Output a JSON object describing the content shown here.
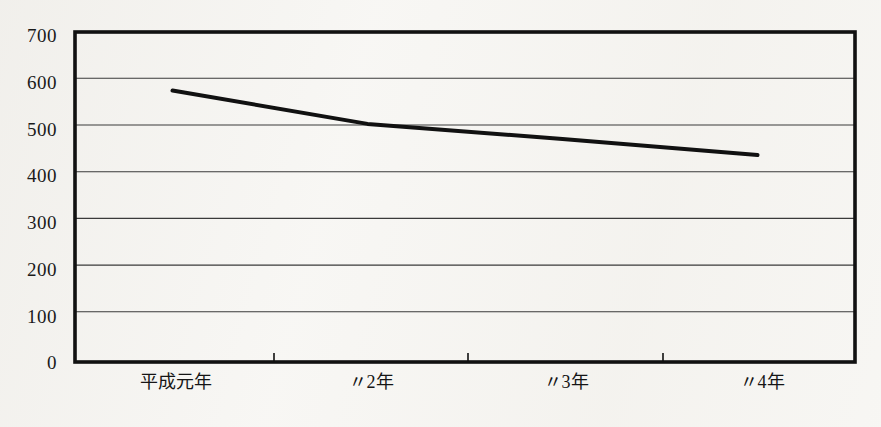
{
  "chart_data": {
    "type": "line",
    "title": "",
    "subtitle": "",
    "xlabel": "",
    "ylabel": "",
    "categories": [
      "平成元年",
      "〃2年",
      "〃3年",
      "〃4年"
    ],
    "values": [
      576,
      505,
      473,
      439
    ],
    "series": [
      {
        "name": "",
        "values": [
          576,
          505,
          473,
          439
        ]
      }
    ],
    "ylim": [
      0,
      700
    ],
    "y_ticks": [
      0,
      100,
      200,
      300,
      400,
      500,
      600,
      700
    ],
    "y_tick_labels": [
      "0",
      "100",
      "200",
      "300",
      "400",
      "500",
      "600",
      "700"
    ],
    "x_tick_labels": [
      "平成元年",
      "〃2年",
      "〃3年",
      "〃4年"
    ],
    "grid": "horizontal",
    "legend": "none",
    "line_color": "#111111",
    "line_width": 4,
    "frame_color": "#111111",
    "gridline_color": "#3a3a3a",
    "background_color": "#f7f6f3",
    "annotations": []
  },
  "axes": {
    "y_axis_name": "value-axis",
    "x_axis_name": "year-axis"
  }
}
